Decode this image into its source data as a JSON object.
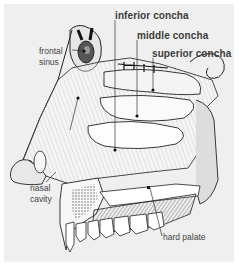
{
  "figure": {
    "background_color": "#efefef",
    "labels": {
      "frontal_sinus": {
        "line1": "frontal",
        "line2": "sinus"
      },
      "inferior_concha": "inferior concha",
      "middle_concha": "middle concha",
      "superior_concha": "superior concha",
      "nasal_cavity": {
        "line1": "nasal",
        "line2": "cavity"
      },
      "hard_palate": "hard palate"
    }
  }
}
